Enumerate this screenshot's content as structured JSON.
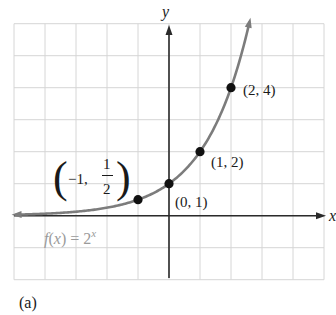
{
  "chart_data": {
    "type": "line",
    "title": "",
    "function_label": {
      "prefix": "f(x) = 2",
      "exponent": "x"
    },
    "xlabel": "x",
    "ylabel": "y",
    "xlim": [
      -5,
      5
    ],
    "ylim": [
      -2,
      6
    ],
    "grid": true,
    "grid_step": 1,
    "series": [
      {
        "name": "f(x) = 2^x",
        "color": "#7c7c7c",
        "function": "2^x",
        "x_range": [
          -4.95,
          2.6
        ],
        "arrows": [
          "left",
          "right"
        ]
      }
    ],
    "points": [
      {
        "x": -1,
        "y": 0.5,
        "label": "(-1, 1/2)"
      },
      {
        "x": 0,
        "y": 1,
        "label": "(0, 1)"
      },
      {
        "x": 1,
        "y": 2,
        "label": "(1, 2)"
      },
      {
        "x": 2,
        "y": 4,
        "label": "(2, 4)"
      }
    ],
    "annotations": {
      "point_labels": {
        "p0": {
          "open": "(",
          "text": "−1,",
          "num": "1",
          "den": "2",
          "close": ")"
        },
        "p1": "(0, 1)",
        "p2": "(1, 2)",
        "p3": "(2, 4)"
      },
      "subfigure_label": "(a)"
    }
  },
  "colors": {
    "grid": "#d6d6d6",
    "axis": "#2a2a2a",
    "curve": "#7c7c7c",
    "point": "#111111",
    "function_label": "#9a9a9a"
  }
}
